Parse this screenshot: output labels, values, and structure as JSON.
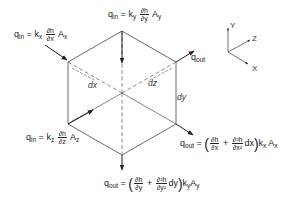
{
  "diagram": {
    "type": "isometric-cube-flow",
    "flux_labels": {
      "q_in_x": {
        "q": "q",
        "q_sub": "in",
        "eq": "=",
        "k": "k",
        "k_sub": "x",
        "num": "∂h",
        "den": "∂x",
        "A": "A",
        "A_sub": "x"
      },
      "q_in_y": {
        "q": "q",
        "q_sub": "in",
        "eq": "=",
        "k": "k",
        "k_sub": "y",
        "num": "∂h",
        "den": "∂y",
        "A": "A",
        "A_sub": "y"
      },
      "q_in_z": {
        "q": "q",
        "q_sub": "in",
        "eq": "=",
        "k": "k",
        "k_sub": "z",
        "num": "∂h",
        "den": "∂z",
        "A": "A",
        "A_sub": "z"
      },
      "q_out_right": {
        "q": "q",
        "q_sub": "out"
      },
      "q_out_x": {
        "q": "q",
        "q_sub": "out",
        "eq": "=",
        "lparen": "(",
        "num1": "∂h",
        "den1": "∂x",
        "plus": "+",
        "num2": "∂²h",
        "den2": "∂x²",
        "d": "dx",
        "rparen": ")",
        "k": "k",
        "k_sub": "x",
        "A": "A",
        "A_sub": "x"
      },
      "q_out_y": {
        "q": "q",
        "q_sub": "out",
        "eq": "=",
        "lparen": "(",
        "num1": "∂h",
        "den1": "∂y",
        "plus": "+",
        "num2": "∂²h",
        "den2": "∂y²",
        "d": "dy",
        "rparen": ")",
        "k": "k",
        "k_sub": "y",
        "A": "A",
        "A_sub": "y"
      }
    },
    "dimensions": {
      "dx": "dx",
      "dz": "dz",
      "dy": "dy"
    },
    "axes": {
      "y": "Y",
      "z": "Z",
      "x": "X"
    },
    "colors": {
      "line": "#333333",
      "background": "#ffffff"
    }
  }
}
